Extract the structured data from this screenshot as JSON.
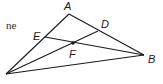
{
  "diagram": {
    "type": "geometry-triangle",
    "text_fragment": "ne",
    "points": {
      "A": {
        "label": "A",
        "x": 69,
        "y": 14,
        "lx": 64,
        "ly": 10
      },
      "B": {
        "label": "B",
        "x": 144,
        "y": 55,
        "lx": 148,
        "ly": 63
      },
      "C": {
        "label": "",
        "x": 6,
        "y": 74
      },
      "D": {
        "label": "D",
        "x": 98,
        "y": 31,
        "lx": 101,
        "ly": 28
      },
      "E": {
        "label": "E",
        "x": 45,
        "y": 37,
        "lx": 33,
        "ly": 40
      },
      "F": {
        "label": "F",
        "x": 73,
        "y": 43,
        "lx": 69,
        "ly": 58
      }
    },
    "segments": [
      {
        "from": "A",
        "to": "C"
      },
      {
        "from": "A",
        "to": "B"
      },
      {
        "from": "C",
        "to": "B"
      },
      {
        "from": "C",
        "to": "D"
      },
      {
        "from": "E",
        "to": "B"
      }
    ],
    "marked_points": [
      "F"
    ],
    "colors": {
      "line": "#1a1a1a",
      "background": "#ffffff"
    }
  }
}
